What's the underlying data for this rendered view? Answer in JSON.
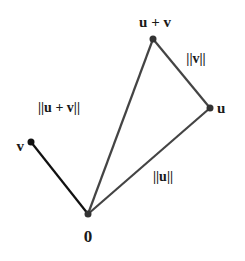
{
  "diagram": {
    "colors": {
      "v_segment": "#111111",
      "triangle_segments": "#444444",
      "points": "#333333",
      "labels": "#1a1a1a"
    },
    "points": {
      "origin": {
        "label": "0",
        "x": 88,
        "y": 214
      },
      "u": {
        "label": "u",
        "x": 210,
        "y": 108
      },
      "v": {
        "label": "v",
        "x": 31,
        "y": 142
      },
      "u_plus_v": {
        "label": "u + v",
        "x": 153,
        "y": 39
      }
    },
    "edge_labels": {
      "norm_u": "||u||",
      "norm_v": "||v||",
      "norm_u_plus_v": "||u + v||"
    }
  }
}
